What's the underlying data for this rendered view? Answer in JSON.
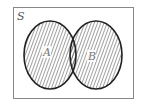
{
  "diagram": {
    "type": "venn",
    "universe_label": "S",
    "sets": [
      {
        "label": "A",
        "shaded": true
      },
      {
        "label": "B",
        "shaded": true
      }
    ],
    "shading": "union",
    "colors": {
      "stroke": "#222222",
      "hatch": "#444444",
      "frame": "#888888",
      "background": "#ffffff"
    }
  }
}
